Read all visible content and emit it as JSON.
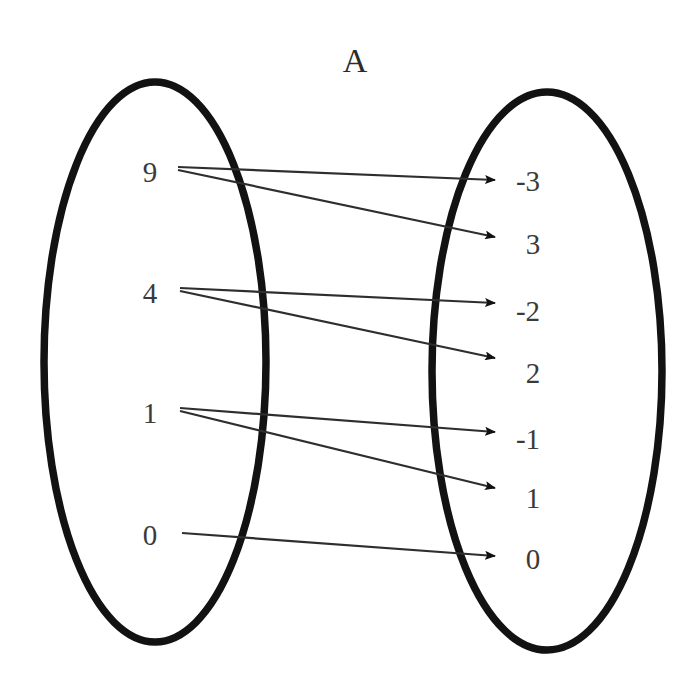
{
  "diagram": {
    "title": "A",
    "type": "mapping-diagram",
    "domain_set": {
      "name": "A",
      "label": "A",
      "elements": [
        {
          "id": "d9",
          "label": "9",
          "x": 150,
          "y": 172
        },
        {
          "id": "d4",
          "label": "4",
          "x": 150,
          "y": 293
        },
        {
          "id": "d1",
          "label": "1",
          "x": 150,
          "y": 413
        },
        {
          "id": "d0",
          "label": "0",
          "x": 150,
          "y": 535
        }
      ],
      "ellipse": {
        "cx": 155,
        "cy": 362,
        "rx": 111,
        "ry": 280
      }
    },
    "codomain_set": {
      "name": "",
      "label": "",
      "elements": [
        {
          "id": "r-3",
          "label": "-3",
          "x": 528,
          "y": 180
        },
        {
          "id": "r3",
          "label": "3",
          "x": 533,
          "y": 243
        },
        {
          "id": "r-2",
          "label": "-2",
          "x": 528,
          "y": 310
        },
        {
          "id": "r2",
          "label": "2",
          "x": 533,
          "y": 372
        },
        {
          "id": "r-1",
          "label": "-1",
          "x": 528,
          "y": 438
        },
        {
          "id": "r1",
          "label": "1",
          "x": 533,
          "y": 497
        },
        {
          "id": "r0",
          "label": "0",
          "x": 533,
          "y": 558
        }
      ],
      "ellipse": {
        "cx": 547,
        "cy": 371,
        "rx": 115,
        "ry": 279
      }
    },
    "arrows": [
      {
        "name": "arrow-9-to-neg3",
        "from": "9",
        "to": "-3",
        "x1": 178,
        "y1": 167,
        "x2": 497,
        "y2": 180
      },
      {
        "name": "arrow-9-to-3",
        "from": "9",
        "to": "3",
        "x1": 178,
        "y1": 170,
        "x2": 497,
        "y2": 237
      },
      {
        "name": "arrow-4-to-neg2",
        "from": "4",
        "to": "-2",
        "x1": 180,
        "y1": 288,
        "x2": 497,
        "y2": 303
      },
      {
        "name": "arrow-4-to-2",
        "from": "4",
        "to": "2",
        "x1": 180,
        "y1": 291,
        "x2": 497,
        "y2": 358
      },
      {
        "name": "arrow-1-to-neg1",
        "from": "1",
        "to": "-1",
        "x1": 180,
        "y1": 408,
        "x2": 497,
        "y2": 432
      },
      {
        "name": "arrow-1-to-1",
        "from": "1",
        "to": "1",
        "x1": 180,
        "y1": 411,
        "x2": 497,
        "y2": 488
      },
      {
        "name": "arrow-0-to-0",
        "from": "0",
        "to": "0",
        "x1": 182,
        "y1": 533,
        "x2": 497,
        "y2": 556
      }
    ],
    "title_position": {
      "x": 355,
      "y": 72
    }
  },
  "colors": {
    "ellipse_stroke": "#121212",
    "arrow_stroke": "#2e2e2e",
    "text": "#3a3a3a",
    "title": "#2b2b2b",
    "background": "#ffffff"
  }
}
